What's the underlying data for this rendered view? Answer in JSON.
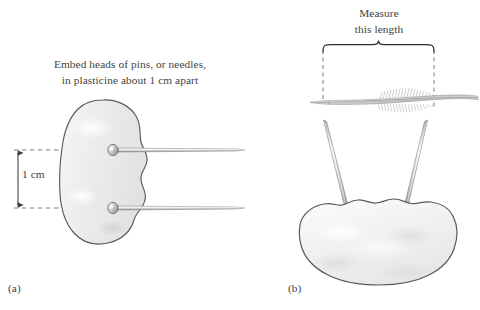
{
  "figure": {
    "panel_a": {
      "label": "(a)",
      "instruction_line_1": "Embed heads of pins, or needles,",
      "instruction_line_2": "in plasticine about 1 cm apart",
      "dimension_label": "1 cm",
      "objects": {
        "plasticine_blob": "plasticine-blob",
        "pin_upper": "pin-upper",
        "pin_lower": "pin-lower",
        "dimension_arrow": "dimension-arrow-1cm",
        "guide_line_upper": "guide-line-upper",
        "guide_line_lower": "guide-line-lower"
      }
    },
    "panel_b": {
      "label": "(b)",
      "measure_line_1": "Measure",
      "measure_line_2": "this length",
      "objects": {
        "brace": "measure-brace",
        "dashed_left": "dashed-guide-left",
        "dashed_right": "dashed-guide-right",
        "feather": "feather",
        "needle_left": "needle-left",
        "needle_right": "needle-right",
        "plasticine_blob": "plasticine-blob-b"
      }
    },
    "colors": {
      "background": "#ffffff",
      "text": "#434343",
      "outline": "#555555",
      "blob_fill": "#eeeeee",
      "metal_light": "#f2f2f2",
      "metal_mid": "#c9c9c9",
      "metal_dark": "#8e8e8e",
      "dashed_guide": "#6f6f6f",
      "feather_gray": "#b7b7b7"
    }
  }
}
